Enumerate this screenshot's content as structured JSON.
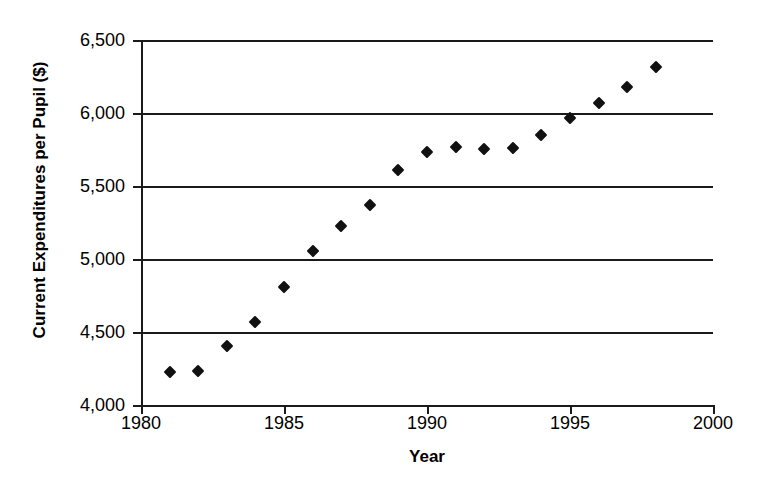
{
  "chart_data": {
    "type": "scatter",
    "title": "",
    "xlabel": "Year",
    "ylabel": "Current Expenditures per Pupil ($)",
    "xlim": [
      1980,
      2000
    ],
    "ylim": [
      4000,
      6500
    ],
    "xticks": [
      "1980",
      "1985",
      "1990",
      "1995",
      "2000"
    ],
    "xtick_values": [
      1980,
      1985,
      1990,
      1995,
      2000
    ],
    "yticks": [
      "4,000",
      "4,500",
      "5,000",
      "5,500",
      "6,000",
      "6,500"
    ],
    "ytick_values": [
      4000,
      4500,
      5000,
      5500,
      6000,
      6500
    ],
    "grid": "horizontal",
    "legend": "none",
    "marker": "diamond",
    "marker_color": "#111111",
    "x": [
      1981,
      1982,
      1983,
      1984,
      1985,
      1986,
      1987,
      1988,
      1989,
      1990,
      1991,
      1992,
      1993,
      1994,
      1995,
      1996,
      1997,
      1998
    ],
    "values": [
      4225,
      4235,
      4405,
      4570,
      4810,
      5055,
      5225,
      5370,
      5610,
      5730,
      5765,
      5755,
      5760,
      5850,
      5965,
      6070,
      6180,
      6315
    ],
    "points": [
      {
        "year": 1981,
        "value": 4225
      },
      {
        "year": 1982,
        "value": 4235
      },
      {
        "year": 1983,
        "value": 4405
      },
      {
        "year": 1984,
        "value": 4570
      },
      {
        "year": 1985,
        "value": 4810
      },
      {
        "year": 1986,
        "value": 5055
      },
      {
        "year": 1987,
        "value": 5225
      },
      {
        "year": 1988,
        "value": 5370
      },
      {
        "year": 1989,
        "value": 5610
      },
      {
        "year": 1990,
        "value": 5730
      },
      {
        "year": 1991,
        "value": 5765
      },
      {
        "year": 1992,
        "value": 5755
      },
      {
        "year": 1993,
        "value": 5760
      },
      {
        "year": 1994,
        "value": 5850
      },
      {
        "year": 1995,
        "value": 5965
      },
      {
        "year": 1996,
        "value": 6070
      },
      {
        "year": 1997,
        "value": 6180
      },
      {
        "year": 1998,
        "value": 6315
      }
    ]
  },
  "axes": {
    "y_title": "Current Expenditures per Pupil ($)",
    "x_title": "Year"
  }
}
